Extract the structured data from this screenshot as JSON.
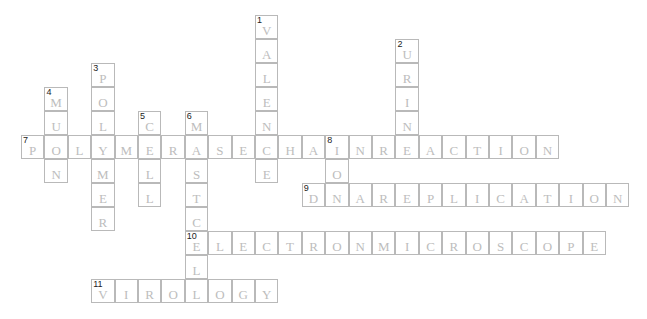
{
  "puzzle": {
    "type": "crossword",
    "cell_size": 23.4,
    "words": [
      {
        "number": "1",
        "answer": "VALENCE",
        "direction": "down",
        "row": 0,
        "col": 10
      },
      {
        "number": "2",
        "answer": "URINE",
        "direction": "down",
        "row": 1,
        "col": 16
      },
      {
        "number": "3",
        "answer": "POLYMER",
        "direction": "down",
        "row": 2,
        "col": 3
      },
      {
        "number": "4",
        "answer": "MUON",
        "direction": "down",
        "row": 3,
        "col": 1
      },
      {
        "number": "5",
        "answer": "CELL",
        "direction": "down",
        "row": 4,
        "col": 5
      },
      {
        "number": "6",
        "answer": "MASTCELL",
        "direction": "down",
        "row": 4,
        "col": 7
      },
      {
        "number": "7",
        "answer": "POLYMERASECHAINREACTION",
        "direction": "across",
        "row": 5,
        "col": 0
      },
      {
        "number": "8",
        "answer": "ION",
        "direction": "down",
        "row": 5,
        "col": 13
      },
      {
        "number": "9",
        "answer": "DNAREPLICATION",
        "direction": "across",
        "row": 7,
        "col": 12
      },
      {
        "number": "10",
        "answer": "ELECTRONMICROSCOPE",
        "direction": "across",
        "row": 9,
        "col": 7
      },
      {
        "number": "11",
        "answer": "VIROLOGY",
        "direction": "across",
        "row": 11,
        "col": 3
      }
    ]
  },
  "colors": {
    "border": "#b9b9b9",
    "letter": "#bdbdbd",
    "number": "#222222"
  }
}
